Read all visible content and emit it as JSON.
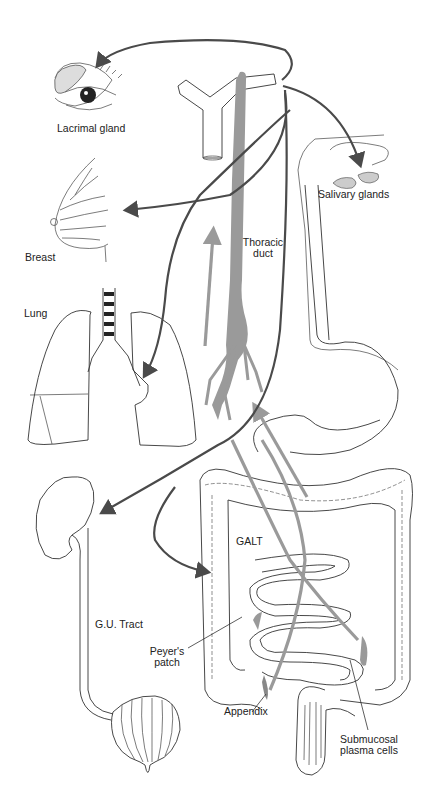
{
  "diagram": {
    "type": "anatomical-pathway",
    "colors": {
      "background": "#ffffff",
      "outline": "#333333",
      "dark_arrow": "#4a4a4a",
      "gray_arrow": "#9a9a9a",
      "thoracic_duct_fill": "#9a9a9a"
    },
    "labels": {
      "lacrimal_gland": "Lacrimal gland",
      "salivary_glands": "Salivary glands",
      "breast": "Breast",
      "thoracic_duct_line1": "Thoracic",
      "thoracic_duct_line2": "duct",
      "lung": "Lung",
      "galt": "GALT",
      "gu_tract": "G.U. Tract",
      "peyers_patch_line1": "Peyer's",
      "peyers_patch_line2": "patch",
      "appendix": "Appendix",
      "submucosal_line1": "Submucosal",
      "submucosal_line2": "plasma cells"
    },
    "structures": [
      "eye-with-lacrimal-gland",
      "brachiocephalic-veins",
      "salivary-glands",
      "esophagus-and-stomach",
      "breast",
      "thoracic-duct",
      "lungs-and-trachea",
      "kidney-ureter-bladder",
      "large-intestine",
      "small-intestine",
      "appendix",
      "rectum"
    ],
    "arrows": [
      {
        "from": "venous-junction",
        "to": "Lacrimal gland",
        "style": "dark"
      },
      {
        "from": "venous-junction",
        "to": "Salivary glands",
        "style": "dark"
      },
      {
        "from": "venous-junction",
        "to": "Breast",
        "style": "dark"
      },
      {
        "from": "venous-junction",
        "to": "Lung",
        "style": "dark"
      },
      {
        "from": "venous-junction",
        "to": "G.U. Tract",
        "style": "dark"
      },
      {
        "from": "venous-junction",
        "to": "GALT",
        "style": "dark"
      },
      {
        "from": "GALT",
        "to": "Thoracic duct",
        "style": "gray"
      },
      {
        "from": "Appendix",
        "to": "Thoracic duct",
        "style": "gray"
      }
    ]
  }
}
